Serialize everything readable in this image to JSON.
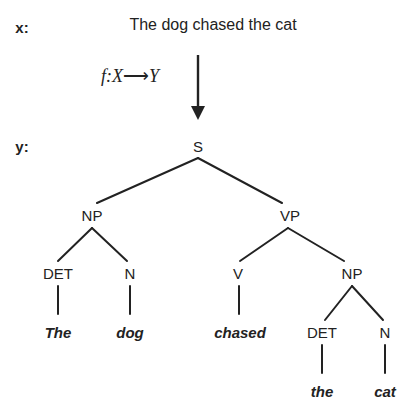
{
  "figure": {
    "input_row": {
      "label": "x:",
      "label_x": 22,
      "label_y": 27,
      "sentence": "The dog chased the cat",
      "sentence_x": 213,
      "sentence_y": 25
    },
    "mapping": {
      "label": "f:X",
      "arrow_glyph": "⟶",
      "label_tail": "Y",
      "label_x": 130,
      "label_y": 76,
      "arrow_icon": "down-arrow-icon",
      "arrow_x": 198,
      "arrow_top": 55,
      "arrow_bottom": 120
    },
    "output_row": {
      "label": "y:",
      "label_x": 22,
      "label_y": 146
    },
    "tree": {
      "nodes": [
        {
          "id": "S",
          "label": "S",
          "x": 198,
          "y": 146,
          "kind": "node"
        },
        {
          "id": "NP1",
          "label": "NP",
          "x": 92,
          "y": 215,
          "kind": "node"
        },
        {
          "id": "VP",
          "label": "VP",
          "x": 290,
          "y": 215,
          "kind": "node"
        },
        {
          "id": "DET1",
          "label": "DET",
          "x": 58,
          "y": 273,
          "kind": "node"
        },
        {
          "id": "N1",
          "label": "N",
          "x": 130,
          "y": 273,
          "kind": "node"
        },
        {
          "id": "V",
          "label": "V",
          "x": 238,
          "y": 273,
          "kind": "node"
        },
        {
          "id": "NP2",
          "label": "NP",
          "x": 352,
          "y": 273,
          "kind": "node"
        },
        {
          "id": "DET2",
          "label": "DET",
          "x": 322,
          "y": 332,
          "kind": "node"
        },
        {
          "id": "N2",
          "label": "N",
          "x": 385,
          "y": 332,
          "kind": "node"
        },
        {
          "id": "w_the1",
          "label": "The",
          "x": 58,
          "y": 332,
          "kind": "terminal"
        },
        {
          "id": "w_dog",
          "label": "dog",
          "x": 130,
          "y": 332,
          "kind": "terminal"
        },
        {
          "id": "w_chased",
          "label": "chased",
          "x": 240,
          "y": 332,
          "kind": "terminal"
        },
        {
          "id": "w_the2",
          "label": "the",
          "x": 322,
          "y": 391,
          "kind": "terminal"
        },
        {
          "id": "w_cat",
          "label": "cat",
          "x": 385,
          "y": 391,
          "kind": "terminal"
        }
      ],
      "edges": [
        {
          "from": "S",
          "to": "NP1",
          "x1": 198,
          "y1": 158,
          "x2": 97,
          "y2": 203
        },
        {
          "from": "S",
          "to": "VP",
          "x1": 198,
          "y1": 158,
          "x2": 282,
          "y2": 203
        },
        {
          "from": "NP1",
          "to": "DET1",
          "x1": 92,
          "y1": 228,
          "x2": 58,
          "y2": 261
        },
        {
          "from": "NP1",
          "to": "N1",
          "x1": 92,
          "y1": 228,
          "x2": 127,
          "y2": 261
        },
        {
          "from": "VP",
          "to": "V",
          "x1": 288,
          "y1": 228,
          "x2": 240,
          "y2": 261
        },
        {
          "from": "VP",
          "to": "NP2",
          "x1": 288,
          "y1": 228,
          "x2": 344,
          "y2": 261
        },
        {
          "from": "DET1",
          "to": "w_the1",
          "x1": 58,
          "y1": 286,
          "x2": 58,
          "y2": 314
        },
        {
          "from": "N1",
          "to": "w_dog",
          "x1": 130,
          "y1": 286,
          "x2": 130,
          "y2": 314
        },
        {
          "from": "V",
          "to": "w_chased",
          "x1": 239,
          "y1": 286,
          "x2": 239,
          "y2": 314
        },
        {
          "from": "NP2",
          "to": "DET2",
          "x1": 352,
          "y1": 286,
          "x2": 325,
          "y2": 320
        },
        {
          "from": "NP2",
          "to": "N2",
          "x1": 352,
          "y1": 286,
          "x2": 383,
          "y2": 320
        },
        {
          "from": "DET2",
          "to": "w_the2",
          "x1": 322,
          "y1": 345,
          "x2": 322,
          "y2": 373
        },
        {
          "from": "N2",
          "to": "w_cat",
          "x1": 385,
          "y1": 345,
          "x2": 385,
          "y2": 373
        }
      ]
    },
    "colors": {
      "ink": "#222222",
      "background": "#ffffff"
    }
  }
}
